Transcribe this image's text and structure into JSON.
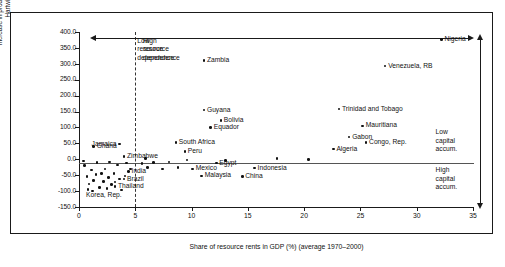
{
  "chart_data": {
    "type": "scatter",
    "title": "",
    "xlabel": "Share of resource rents in GDP (%) (average 1970–2000)",
    "ylabel_lines": [
      "Increase in produced capital standard (%)",
      "Hartwick rule followed"
    ],
    "xlim": [
      0,
      35
    ],
    "ylim": [
      -150,
      400
    ],
    "xticks": [
      "0",
      "5",
      "10",
      "15",
      "20",
      "25",
      "30",
      "35"
    ],
    "xtick_values": [
      0,
      5,
      10,
      15,
      20,
      25,
      30,
      35
    ],
    "yticks": [
      "400.0",
      "350.0",
      "300.0",
      "250.0",
      "200.0",
      "150.0",
      "100.0",
      "50.0",
      "0.0",
      "-50.0",
      "-100.0",
      "-150.0"
    ],
    "ytick_values": [
      400,
      350,
      300,
      250,
      200,
      150,
      100,
      50,
      0,
      -50,
      -100,
      -150
    ],
    "grid": false,
    "legend": "none",
    "zero_line": 0,
    "divider_x": 5,
    "annotations": [
      {
        "name": "low-resource-dependence",
        "lines": [
          "Low",
          "resource",
          "dependence"
        ],
        "x": 5.0,
        "y": 372
      },
      {
        "name": "high-resource-dependence",
        "lines": [
          "High",
          "resource",
          "dependence"
        ],
        "x": 5.5,
        "y": 372
      },
      {
        "name": "low-capital-accum",
        "lines": [
          "Low",
          "capital",
          "accum."
        ],
        "x": 31.5,
        "y": 85
      },
      {
        "name": "high-capital-accum",
        "lines": [
          "High",
          "capital",
          "accum."
        ],
        "x": 31.5,
        "y": -35
      }
    ],
    "labeled_points": [
      {
        "label": "Nigeria",
        "x": 32.2,
        "y": 376,
        "label_pos": "right"
      },
      {
        "label": "Zambia",
        "x": 11.1,
        "y": 310,
        "label_pos": "right"
      },
      {
        "label": "Venezuela, RB",
        "x": 27.2,
        "y": 293,
        "label_pos": "right"
      },
      {
        "label": "Guyana",
        "x": 11.1,
        "y": 155,
        "label_pos": "right"
      },
      {
        "label": "Trinidad and Tobago",
        "x": 23.1,
        "y": 158,
        "label_pos": "right"
      },
      {
        "label": "Bolivia",
        "x": 12.6,
        "y": 122,
        "label_pos": "right"
      },
      {
        "label": "Equador",
        "x": 11.7,
        "y": 100,
        "label_pos": "right"
      },
      {
        "label": "Mauritiana",
        "x": 25.2,
        "y": 105,
        "label_pos": "right"
      },
      {
        "label": "Gabon",
        "x": 24.0,
        "y": 70,
        "label_pos": "right"
      },
      {
        "label": "Congo, Rep.",
        "x": 25.5,
        "y": 52,
        "label_pos": "right"
      },
      {
        "label": "South Africa",
        "x": 8.6,
        "y": 52,
        "label_pos": "right"
      },
      {
        "label": "Algeria",
        "x": 22.6,
        "y": 32,
        "label_pos": "right"
      },
      {
        "label": "Peru",
        "x": 9.4,
        "y": 25,
        "label_pos": "right"
      },
      {
        "label": "Ghana",
        "x": 1.3,
        "y": 40,
        "label_pos": "right"
      },
      {
        "label": "Jamaica",
        "x": 3.6,
        "y": 48,
        "label_pos": "left"
      },
      {
        "label": "Zimbabwe",
        "x": 4.0,
        "y": 8,
        "label_pos": "right"
      },
      {
        "label": "Egypt",
        "x": 12.2,
        "y": -12,
        "label_pos": "right"
      },
      {
        "label": "Mexico",
        "x": 10.1,
        "y": -30,
        "label_pos": "right"
      },
      {
        "label": "Indonesia",
        "x": 15.6,
        "y": -28,
        "label_pos": "right"
      },
      {
        "label": "Malaysia",
        "x": 10.9,
        "y": -52,
        "label_pos": "right"
      },
      {
        "label": "China",
        "x": 14.5,
        "y": -55,
        "label_pos": "right"
      },
      {
        "label": "India",
        "x": 4.4,
        "y": -38,
        "label_pos": "right"
      },
      {
        "label": "Brazil",
        "x": 4.0,
        "y": -62,
        "label_pos": "right"
      },
      {
        "label": "Thailand",
        "x": 3.2,
        "y": -85,
        "label_pos": "right"
      },
      {
        "label": "Korea, Rep.",
        "x": 0.8,
        "y": -95,
        "label_pos": "below-left"
      }
    ],
    "unlabeled_points": [
      {
        "x": 0.5,
        "y": -20
      },
      {
        "x": 1.1,
        "y": -34
      },
      {
        "x": 1.5,
        "y": -48
      },
      {
        "x": 0.7,
        "y": -55
      },
      {
        "x": 1.3,
        "y": -66
      },
      {
        "x": 0.9,
        "y": -78
      },
      {
        "x": 1.8,
        "y": -88
      },
      {
        "x": 2.3,
        "y": -30
      },
      {
        "x": 2.0,
        "y": -44
      },
      {
        "x": 2.6,
        "y": -58
      },
      {
        "x": 2.2,
        "y": -70
      },
      {
        "x": 2.9,
        "y": -80
      },
      {
        "x": 2.5,
        "y": -92
      },
      {
        "x": 3.4,
        "y": -18
      },
      {
        "x": 3.1,
        "y": -44
      },
      {
        "x": 3.6,
        "y": -62
      },
      {
        "x": 3.2,
        "y": -72
      },
      {
        "x": 1.6,
        "y": -10
      },
      {
        "x": 2.7,
        "y": -8
      },
      {
        "x": 4.2,
        "y": -12
      },
      {
        "x": 4.6,
        "y": -30
      },
      {
        "x": 4.1,
        "y": -52
      },
      {
        "x": 5.6,
        "y": -14
      },
      {
        "x": 6.1,
        "y": -26
      },
      {
        "x": 6.6,
        "y": -10
      },
      {
        "x": 7.4,
        "y": -30
      },
      {
        "x": 8.0,
        "y": -8
      },
      {
        "x": 8.8,
        "y": -26
      },
      {
        "x": 9.6,
        "y": -2
      },
      {
        "x": 13.0,
        "y": -4
      },
      {
        "x": 17.6,
        "y": 2
      },
      {
        "x": 20.4,
        "y": 0
      },
      {
        "x": 5.9,
        "y": 2
      },
      {
        "x": 0.4,
        "y": -6
      },
      {
        "x": 3.8,
        "y": -96
      },
      {
        "x": 1.2,
        "y": -100
      }
    ]
  }
}
